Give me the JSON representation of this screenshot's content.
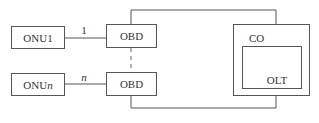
{
  "diagram": {
    "nodes": {
      "onu1": {
        "label": "ONU1"
      },
      "onun": {
        "label_prefix": "ONU",
        "label_suffix": "n"
      },
      "obd_top": {
        "label": "OBD"
      },
      "obd_bottom": {
        "label": "OBD"
      },
      "co": {
        "label": "CO"
      },
      "olt": {
        "label": "OLT"
      }
    },
    "edges": {
      "onu1_obd": {
        "label": "1"
      },
      "onun_obd": {
        "label": "n"
      }
    }
  }
}
